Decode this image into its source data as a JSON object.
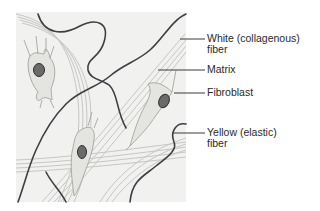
{
  "diagram": {
    "labels": [
      {
        "id": "white-fiber",
        "line1": "White (collagenous)",
        "line2": "fiber"
      },
      {
        "id": "matrix",
        "line1": "Matrix",
        "line2": ""
      },
      {
        "id": "fibroblast",
        "line1": "Fibroblast",
        "line2": ""
      },
      {
        "id": "yellow-fiber",
        "line1": "Yellow (elastic)",
        "line2": "fiber"
      }
    ],
    "colors": {
      "background": "#ffffff",
      "panel": "#f1f1f0",
      "collagen_fiber": "#c9c9c6",
      "elastic_fiber": "#3e3e44",
      "cell_body": "#e4e4e1",
      "nucleus": "#5a5a5a",
      "leader_line": "#3a3a3a"
    }
  }
}
